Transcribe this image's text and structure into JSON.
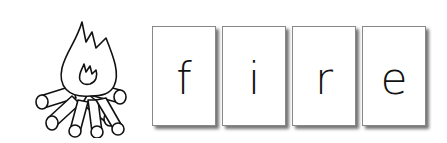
{
  "illustration": {
    "name": "campfire",
    "icon": "campfire-icon"
  },
  "word": "fire",
  "cards": [
    {
      "letter": "f"
    },
    {
      "letter": "i"
    },
    {
      "letter": "r"
    },
    {
      "letter": "e"
    }
  ]
}
